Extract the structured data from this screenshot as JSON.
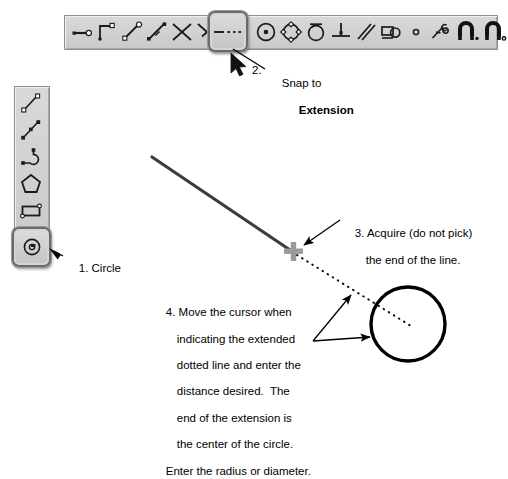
{
  "document": {
    "title": "Snap to Extension / Circle instructional diagram",
    "background_color": "#ffffff"
  },
  "toolbars": {
    "top": {
      "name": "snap-toolbar",
      "orientation": "horizontal",
      "selected_index": 6,
      "items": [
        {
          "icon": "snap-endpoint-icon",
          "label": "Snap to Endpoint"
        },
        {
          "icon": "snap-corner-icon",
          "label": "Snap to Corner"
        },
        {
          "icon": "snap-midpoint-icon",
          "label": "Snap to Midpoint"
        },
        {
          "icon": "snap-nearest-icon",
          "label": "Snap to Nearest"
        },
        {
          "icon": "snap-intersection-icon",
          "label": "Snap to Intersection"
        },
        {
          "icon": "snap-apparent-intersection-icon",
          "label": "Snap to Apparent Intersection"
        },
        {
          "icon": "snap-extension-icon",
          "label": "Snap to Extension"
        },
        {
          "icon": "snap-center-icon",
          "label": "Snap to Center"
        },
        {
          "icon": "snap-quadrant-icon",
          "label": "Snap to Quadrant"
        },
        {
          "icon": "snap-tangent-icon",
          "label": "Snap to Tangent"
        },
        {
          "icon": "snap-perpendicular-icon",
          "label": "Snap to Perpendicular"
        },
        {
          "icon": "snap-parallel-icon",
          "label": "Snap to Parallel"
        },
        {
          "icon": "snap-insert-icon",
          "label": "Snap to Insertion"
        },
        {
          "icon": "snap-node-icon",
          "label": "Snap to Node"
        },
        {
          "icon": "snap-from-icon",
          "label": "Snap From"
        },
        {
          "icon": "object-snap-on-icon",
          "label": "Object Snap On"
        },
        {
          "icon": "object-snap-off-icon",
          "label": "Object Snap Off"
        }
      ]
    },
    "left": {
      "name": "draw-toolbar",
      "orientation": "vertical",
      "selected_index": 5,
      "items": [
        {
          "icon": "line-icon",
          "label": "Line"
        },
        {
          "icon": "construction-line-icon",
          "label": "Construction Line"
        },
        {
          "icon": "polyline-icon",
          "label": "Polyline"
        },
        {
          "icon": "polygon-icon",
          "label": "Polygon"
        },
        {
          "icon": "rectangle-icon",
          "label": "Rectangle"
        },
        {
          "icon": "arc-icon",
          "label": "Arc"
        },
        {
          "icon": "circle-icon",
          "label": "Circle"
        }
      ]
    }
  },
  "callouts": {
    "step2": {
      "number": "2. ",
      "line1": "Snap to",
      "line2": "Extension"
    },
    "step1": {
      "text": "1. Circle"
    },
    "step3": {
      "line1": "3. Acquire (do not pick)",
      "line2": "the end of the line."
    },
    "step4": {
      "line1": "4. Move the cursor when",
      "line2": "indicating the extended",
      "line3": "dotted line and enter the",
      "line4": "distance desired.  The",
      "line5": "end of the extension is",
      "line6": "the center of the circle.",
      "line7": "Enter the radius or diameter."
    }
  },
  "canvas": {
    "solid_line": {
      "name": "drawn-line",
      "x1": 152,
      "y1": 157,
      "x2": 292,
      "y2": 252,
      "color": "#3a3a3a",
      "width": 3
    },
    "marker": {
      "name": "acquire-crosshair",
      "x": 293,
      "y": 252,
      "color": "#9a9a9a",
      "size": 19
    },
    "dotted_line": {
      "name": "extension-dotted-line",
      "x1": 295,
      "y1": 254,
      "x2": 410,
      "y2": 325,
      "color": "#111111"
    },
    "circle": {
      "name": "drawn-circle",
      "cx": 408,
      "cy": 324,
      "r": 37,
      "color": "#000000",
      "width": 3.2
    }
  },
  "cursor": {
    "name": "mouse-pointer",
    "x": 238,
    "y": 54
  }
}
